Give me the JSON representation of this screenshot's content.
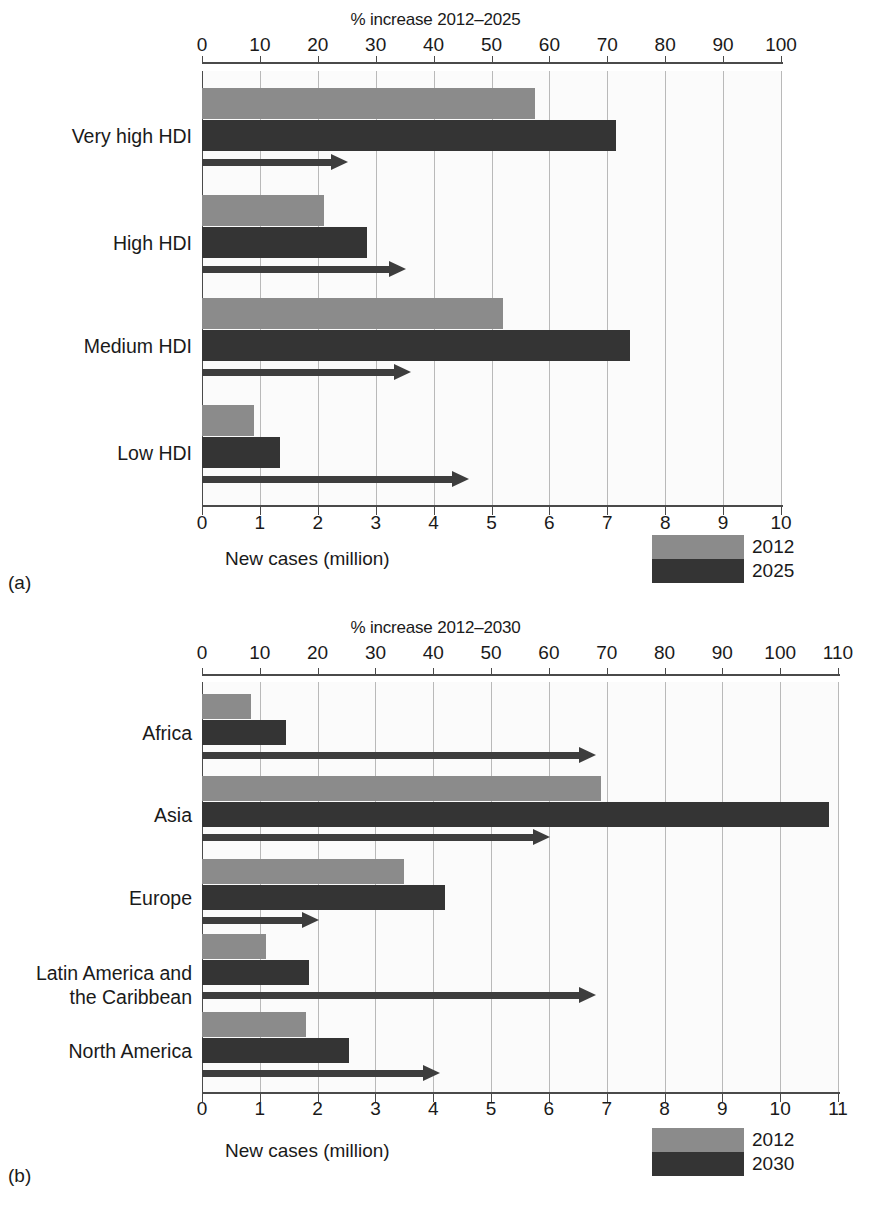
{
  "colors": {
    "series_2012": "#8b8b8b",
    "series_late": "#343434",
    "arrow": "#3d3d3d",
    "grid": "#b9b9b9",
    "axis": "#4a4a4a",
    "plot_bg": "#fbfbfb"
  },
  "panel_a": {
    "letter": "(a)",
    "top_axis_title": "% increase 2012–2025",
    "bottom_axis_caption": "New cases (million)",
    "top_ticks": [
      "0",
      "10",
      "20",
      "30",
      "40",
      "50",
      "60",
      "70",
      "80",
      "90",
      "100"
    ],
    "bottom_ticks": [
      "0",
      "1",
      "2",
      "3",
      "4",
      "5",
      "6",
      "7",
      "8",
      "9",
      "10"
    ],
    "legend": {
      "first": "2012",
      "second": "2025"
    },
    "categories": [
      "Very high HDI",
      "High HDI",
      "Medium HDI",
      "Low HDI"
    ]
  },
  "panel_b": {
    "letter": "(b)",
    "top_axis_title": "% increase 2012–2030",
    "bottom_axis_caption": "New cases (million)",
    "top_ticks": [
      "0",
      "10",
      "20",
      "30",
      "40",
      "50",
      "60",
      "70",
      "80",
      "90",
      "100",
      "110"
    ],
    "bottom_ticks": [
      "0",
      "1",
      "2",
      "3",
      "4",
      "5",
      "6",
      "7",
      "8",
      "9",
      "10",
      "11"
    ],
    "legend": {
      "first": "2012",
      "second": "2030"
    },
    "categories": [
      "Africa",
      "Asia",
      "Europe",
      "Latin America and\nthe Caribbean",
      "North America"
    ]
  },
  "chart_data": [
    {
      "type": "bar",
      "id": "panel-a",
      "title": "% increase 2012–2025",
      "orientation": "horizontal",
      "xlabel": "New cases (million)",
      "ylabel": "",
      "categories": [
        "Very high HDI",
        "High HDI",
        "Medium HDI",
        "Low HDI"
      ],
      "series": [
        {
          "name": "2012",
          "unit": "million new cases",
          "axis": "bottom",
          "xlim": [
            0,
            10
          ],
          "values": [
            5.75,
            2.1,
            5.2,
            0.9
          ]
        },
        {
          "name": "2025",
          "unit": "million new cases",
          "axis": "bottom",
          "xlim": [
            0,
            10
          ],
          "values": [
            7.15,
            2.85,
            7.4,
            1.35
          ]
        },
        {
          "name": "% increase 2012–2025",
          "unit": "percent",
          "axis": "top",
          "xlim": [
            0,
            100
          ],
          "values": [
            25,
            35,
            36,
            46
          ]
        }
      ],
      "bottom_axis": {
        "label": "New cases (million)",
        "ticks": [
          0,
          1,
          2,
          3,
          4,
          5,
          6,
          7,
          8,
          9,
          10
        ],
        "range": [
          0,
          10
        ]
      },
      "top_axis": {
        "label": "% increase 2012–2025",
        "ticks": [
          0,
          10,
          20,
          30,
          40,
          50,
          60,
          70,
          80,
          90,
          100
        ],
        "range": [
          0,
          100
        ]
      },
      "grid": true,
      "legend_position": "bottom-right",
      "legend": [
        "2012",
        "2025"
      ]
    },
    {
      "type": "bar",
      "id": "panel-b",
      "title": "% increase 2012–2030",
      "orientation": "horizontal",
      "xlabel": "New cases (million)",
      "ylabel": "",
      "categories": [
        "Africa",
        "Asia",
        "Europe",
        "Latin America and the Caribbean",
        "North America"
      ],
      "series": [
        {
          "name": "2012",
          "unit": "million new cases",
          "axis": "bottom",
          "xlim": [
            0,
            11
          ],
          "values": [
            0.85,
            6.9,
            3.5,
            1.1,
            1.8
          ]
        },
        {
          "name": "2030",
          "unit": "million new cases",
          "axis": "bottom",
          "xlim": [
            0,
            11
          ],
          "values": [
            1.45,
            10.85,
            4.2,
            1.85,
            2.55
          ]
        },
        {
          "name": "% increase 2012–2030",
          "unit": "percent",
          "axis": "top",
          "xlim": [
            0,
            110
          ],
          "values": [
            68,
            60,
            20,
            68,
            41
          ]
        }
      ],
      "bottom_axis": {
        "label": "New cases (million)",
        "ticks": [
          0,
          1,
          2,
          3,
          4,
          5,
          6,
          7,
          8,
          9,
          10,
          11
        ],
        "range": [
          0,
          11
        ]
      },
      "top_axis": {
        "label": "% increase 2012–2030",
        "ticks": [
          0,
          10,
          20,
          30,
          40,
          50,
          60,
          70,
          80,
          90,
          100,
          110
        ],
        "range": [
          0,
          110
        ]
      },
      "grid": true,
      "legend_position": "bottom-right",
      "legend": [
        "2012",
        "2030"
      ]
    }
  ]
}
